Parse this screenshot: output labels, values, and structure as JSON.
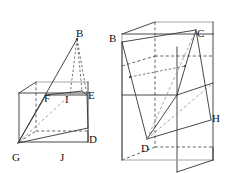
{
  "figure": {
    "background_color": "#ffffff",
    "line_color": "#343434",
    "faint_line_color": "#9a9a9a",
    "dashed_line_color": "#3a3a3a",
    "label_color": "#111111",
    "left_figure": {
      "name": "left-solid",
      "description": "Rectangular box with an inscribed slanted quadrilateral plane and an apex point B above it",
      "labels": [
        {
          "id": "B",
          "text": "B",
          "x": 76,
          "y": 28
        },
        {
          "id": "F",
          "text": "F",
          "x": 44,
          "y": 93
        },
        {
          "id": "I",
          "text": "I",
          "x": 65,
          "y": 94
        },
        {
          "id": "E",
          "text": "E",
          "x": 88,
          "y": 90
        },
        {
          "id": "D",
          "text": "D",
          "x": 89,
          "y": 134
        },
        {
          "id": "G",
          "text": "G",
          "x": 12,
          "y": 152
        },
        {
          "id": "J",
          "text": "J",
          "x": 60,
          "y": 152
        }
      ]
    },
    "right_figure": {
      "name": "right-solid",
      "description": "Taller rectangular box with an inscribed slanted quadrilateral plane B-C-H-D",
      "labels": [
        {
          "id": "B",
          "text": "B",
          "x": 109,
          "y": 33
        },
        {
          "id": "C",
          "text": "C",
          "x": 197,
          "y": 28
        },
        {
          "id": "H",
          "text": "H",
          "x": 212,
          "y": 113
        },
        {
          "id": "D",
          "text": "D",
          "x": 141,
          "y": 143
        }
      ]
    }
  }
}
